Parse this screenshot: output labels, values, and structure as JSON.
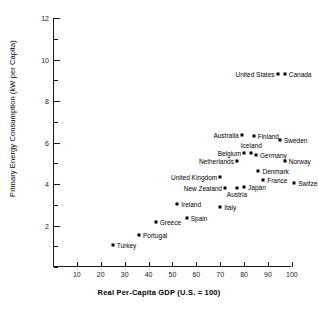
{
  "chart_data": {
    "type": "scatter",
    "title": "",
    "xlabel": "Real Per-Capita GDP (U.S.  =  100)",
    "ylabel": "Primary Energy Consumption (kW per Capita)",
    "xlim": [
      0,
      108
    ],
    "ylim": [
      0,
      12
    ],
    "xticks": [
      10,
      20,
      30,
      40,
      50,
      60,
      70,
      80,
      90,
      100
    ],
    "yticks": [
      0,
      1,
      2,
      3,
      4,
      5,
      6,
      7,
      8,
      9,
      10,
      11,
      12
    ],
    "ytick_labels": [
      2,
      4,
      6,
      8,
      10,
      12
    ],
    "grid": false,
    "legend": "none",
    "points": [
      {
        "name": "Turkey",
        "x": 25,
        "y": 1.05,
        "label_pos": "right"
      },
      {
        "name": "Portugal",
        "x": 36,
        "y": 1.55,
        "label_pos": "right"
      },
      {
        "name": "Greece",
        "x": 43,
        "y": 2.15,
        "label_pos": "right"
      },
      {
        "name": "Spain",
        "x": 56,
        "y": 2.35,
        "label_pos": "right"
      },
      {
        "name": "Ireland",
        "x": 52,
        "y": 3.05,
        "label_pos": "right"
      },
      {
        "name": "Italy",
        "x": 70,
        "y": 2.9,
        "label_pos": "right"
      },
      {
        "name": "New Zealand",
        "x": 72,
        "y": 3.8,
        "label_pos": "left"
      },
      {
        "name": "Austria",
        "x": 77,
        "y": 3.8,
        "label_pos": "below"
      },
      {
        "name": "Japan",
        "x": 80,
        "y": 3.85,
        "label_pos": "right"
      },
      {
        "name": "United Kingdom",
        "x": 70,
        "y": 4.35,
        "label_pos": "left"
      },
      {
        "name": "France",
        "x": 88,
        "y": 4.2,
        "label_pos": "right"
      },
      {
        "name": "Switzerland",
        "x": 101,
        "y": 4.05,
        "label_pos": "right"
      },
      {
        "name": "Denmark",
        "x": 86,
        "y": 4.65,
        "label_pos": "right"
      },
      {
        "name": "Netherlands",
        "x": 77,
        "y": 5.1,
        "label_pos": "left"
      },
      {
        "name": "Norway",
        "x": 97,
        "y": 5.1,
        "label_pos": "right"
      },
      {
        "name": "Belgium",
        "x": 80,
        "y": 5.5,
        "label_pos": "left"
      },
      {
        "name": "Iceland",
        "x": 83,
        "y": 5.5,
        "label_pos": "above"
      },
      {
        "name": "Germany",
        "x": 85,
        "y": 5.4,
        "label_pos": "right"
      },
      {
        "name": "Australia",
        "x": 79,
        "y": 6.35,
        "label_pos": "left"
      },
      {
        "name": "Finland",
        "x": 84,
        "y": 6.3,
        "label_pos": "right"
      },
      {
        "name": "Sweden",
        "x": 95,
        "y": 6.1,
        "label_pos": "right"
      },
      {
        "name": "United States",
        "x": 94,
        "y": 9.3,
        "label_pos": "left"
      },
      {
        "name": "Canada",
        "x": 97,
        "y": 9.3,
        "label_pos": "right"
      }
    ]
  },
  "axes": {
    "x_title": "Real Per-Capita GDP (U.S.  =  100)",
    "y_title": "Primary Energy Consumption (kW per Capita)"
  }
}
